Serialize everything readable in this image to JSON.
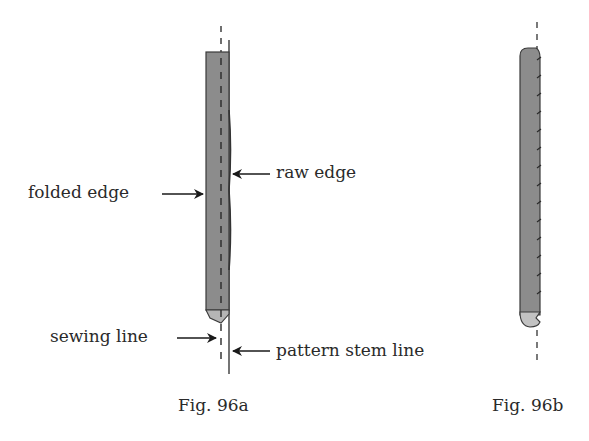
{
  "figures": [
    {
      "id": "fig-96a",
      "caption": "Fig. 96a",
      "labels": {
        "folded_edge": "folded edge",
        "raw_edge": "raw edge",
        "sewing_line": "sewing line",
        "pattern_stem_line": "pattern stem line"
      }
    },
    {
      "id": "fig-96b",
      "caption": "Fig. 96b"
    }
  ],
  "colors": {
    "fabric_fill": "#8c8c8c",
    "fabric_outline": "#3a3a3a",
    "text": "#2a2a2a",
    "line": "#2a2a2a"
  }
}
